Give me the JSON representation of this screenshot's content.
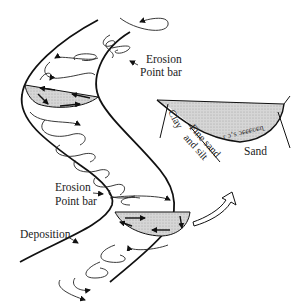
{
  "diagram": {
    "title": "",
    "colors": {
      "line": "#111111",
      "shading": "#d9d9d9",
      "background": "#ffffff"
    },
    "labels": {
      "upper_erosion": "Erosion",
      "upper_point_bar": "Point bar",
      "lower_erosion": "Erosion",
      "lower_point_bar": "Point bar",
      "deposition": "Deposition",
      "cross_section_clay": "Clay",
      "cross_section_fine_sand": "Fine sand",
      "cross_section_and_silt": "and silt",
      "cross_section_sand": "Sand"
    },
    "elements": [
      "meandering-channel-banks",
      "helical-flow-spirals",
      "shaded-cross-section-upper-bend",
      "shaded-cross-section-lower-bend",
      "curved-pointer-arrow",
      "channel-cross-section-inset"
    ]
  }
}
